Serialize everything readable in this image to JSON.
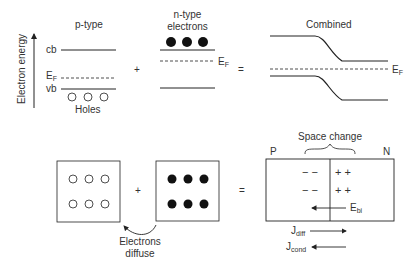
{
  "axis": {
    "label": "Electron energy"
  },
  "ptype": {
    "title": "p-type",
    "cb_label": "cb",
    "ef_label": "E",
    "ef_sub": "F",
    "vb_label": "vb",
    "holes_label": "Holes"
  },
  "ntype": {
    "title_line1": "n-type",
    "title_line2": "electrons",
    "ef_label": "E",
    "ef_sub": "F"
  },
  "combined": {
    "title": "Combined",
    "ef_label": "E",
    "ef_sub": "F"
  },
  "operators": {
    "plus": "+",
    "equals": "="
  },
  "bottom": {
    "diffuse_line1": "Electrons",
    "diffuse_line2": "diffuse",
    "space_charge_label": "Space change",
    "p_label": "P",
    "n_label": "N",
    "minus": "−  −",
    "plus_pair": "+  +",
    "field_label": "E",
    "field_sub": "bi",
    "jdiff_label": "J",
    "jdiff_sub": "diff",
    "jcond_label": "J",
    "jcond_sub": "cond"
  }
}
